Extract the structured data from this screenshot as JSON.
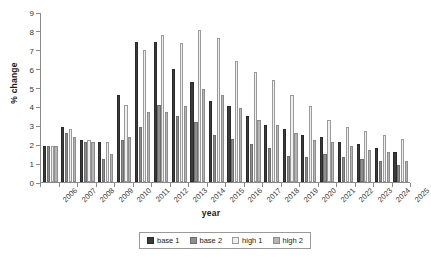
{
  "chart_data": {
    "type": "bar",
    "title": "",
    "xlabel": "year",
    "ylabel": "% change",
    "ylim": [
      0,
      9
    ],
    "ytick_step": 1,
    "yticks": [
      0,
      1,
      2,
      3,
      4,
      5,
      6,
      7,
      8,
      9
    ],
    "grid": false,
    "legend_position": "bottom",
    "categories": [
      "2006",
      "2007",
      "2008",
      "2009",
      "2010",
      "2011",
      "2012",
      "2013",
      "2014",
      "2015",
      "2016",
      "2017",
      "2018",
      "2019",
      "2020",
      "2021",
      "2022",
      "2023",
      "2024",
      "2025"
    ],
    "series": [
      {
        "name": "base 1",
        "color": "#3b3b3b",
        "values": [
          1.9,
          2.9,
          2.2,
          2.1,
          4.6,
          7.4,
          7.4,
          6.0,
          5.3,
          4.3,
          4.0,
          3.5,
          3.0,
          2.8,
          2.5,
          2.4,
          2.1,
          2.0,
          1.8,
          1.6
        ]
      },
      {
        "name": "base 2",
        "color": "#8e8e8e",
        "values": [
          1.9,
          2.6,
          2.1,
          1.2,
          2.2,
          2.9,
          4.1,
          3.5,
          3.2,
          2.5,
          2.3,
          2.0,
          1.8,
          1.4,
          1.3,
          1.5,
          1.3,
          1.2,
          1.1,
          0.9
        ]
      },
      {
        "name": "high 1",
        "color": "#f0f0f0",
        "values": [
          1.9,
          2.8,
          2.2,
          2.1,
          4.1,
          7.0,
          7.8,
          7.35,
          8.05,
          7.65,
          6.4,
          5.8,
          5.4,
          4.6,
          4.0,
          3.3,
          2.9,
          2.7,
          2.5,
          2.3
        ]
      },
      {
        "name": "high 2",
        "color": "#b5b5b5",
        "values": [
          1.9,
          2.4,
          2.1,
          1.5,
          2.4,
          3.7,
          3.7,
          4.0,
          4.9,
          4.6,
          3.9,
          3.3,
          3.0,
          2.6,
          2.2,
          2.1,
          1.9,
          1.7,
          1.6,
          1.1
        ]
      }
    ]
  },
  "axes": {
    "y_title": "% change",
    "x_title": "year"
  },
  "legend": {
    "items": [
      {
        "label": "base 1"
      },
      {
        "label": "base 2"
      },
      {
        "label": "high 1"
      },
      {
        "label": "high 2"
      }
    ]
  }
}
